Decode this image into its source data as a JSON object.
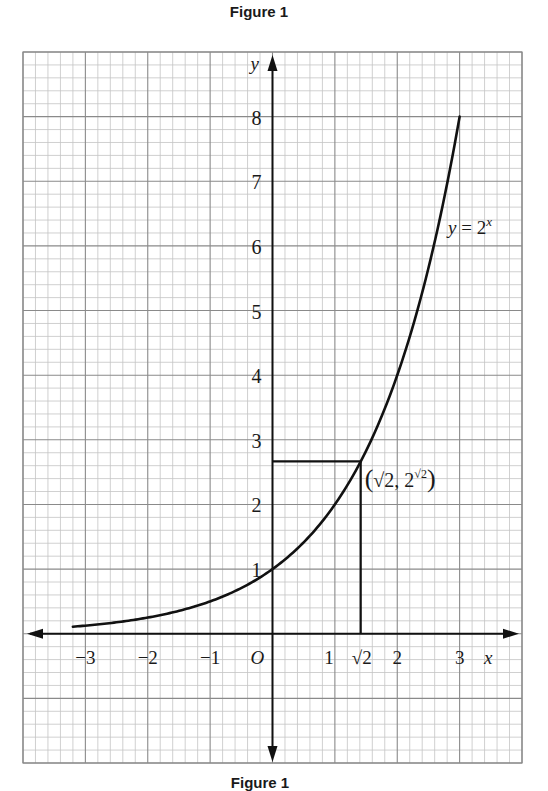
{
  "figure": {
    "title": "Figure 1",
    "caption": "Figure 1"
  },
  "chart_data": {
    "type": "line",
    "title": "Figure 1",
    "xlabel": "x",
    "ylabel": "y",
    "origin_label": "O",
    "xlim": [
      -4,
      4
    ],
    "ylim": [
      -2,
      9
    ],
    "grid": true,
    "grid_major_step": 1,
    "grid_minor_step": 0.2,
    "x_tick_labels": [
      "−3",
      "−2",
      "−1",
      "1",
      "√2",
      "2",
      "3"
    ],
    "x_tick_values": [
      -3,
      -2,
      -1,
      1,
      1.414,
      2,
      3
    ],
    "y_tick_labels": [
      "1",
      "2",
      "3",
      "4",
      "5",
      "6",
      "7",
      "8"
    ],
    "y_tick_values": [
      1,
      2,
      3,
      4,
      5,
      6,
      7,
      8
    ],
    "series": [
      {
        "name": "y = 2^x",
        "label": "y = 2",
        "label_exponent": "x",
        "function": "2^x",
        "x_range": [
          -3.2,
          3
        ],
        "x": [
          -3.2,
          -3,
          -2,
          -1,
          0,
          1,
          1.414,
          2,
          2.5,
          3
        ],
        "y": [
          0.109,
          0.125,
          0.25,
          0.5,
          1,
          2,
          2.665,
          4,
          5.657,
          8
        ]
      }
    ],
    "annotations": [
      {
        "type": "point",
        "label": "(√2, 2^√2)",
        "label_parts": {
          "open": "(",
          "x": "√2",
          "sep": ", ",
          "base": "2",
          "exp": "√2",
          "close": ")"
        },
        "x": 1.414,
        "y": 2.665
      },
      {
        "type": "hline_segment",
        "from_x": 0,
        "to_x": 1.414,
        "y": 2.665
      },
      {
        "type": "vline_segment",
        "x": 1.414,
        "from_y": 0,
        "to_y": 2.665
      }
    ],
    "colors": {
      "curve": "#111111",
      "axes": "#111111",
      "grid_major": "#8a8a8a",
      "grid_minor": "#c4c4c4"
    }
  }
}
